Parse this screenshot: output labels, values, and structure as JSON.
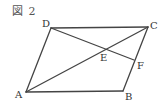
{
  "figure": {
    "title": "図 2",
    "colors": {
      "line": "#444444",
      "label": "#333333",
      "background": "#ffffff"
    },
    "points": {
      "A": {
        "label": "A",
        "x": 26,
        "y": 92
      },
      "B": {
        "label": "B",
        "x": 123,
        "y": 91
      },
      "C": {
        "label": "C",
        "x": 148,
        "y": 27
      },
      "D": {
        "label": "D",
        "x": 51,
        "y": 28
      },
      "E": {
        "label": "E",
        "x": 103,
        "y": 49
      },
      "F": {
        "label": "F",
        "x": 134,
        "y": 60
      }
    },
    "segments": [
      "AB",
      "BC",
      "CD",
      "DA",
      "AC",
      "DF"
    ]
  }
}
